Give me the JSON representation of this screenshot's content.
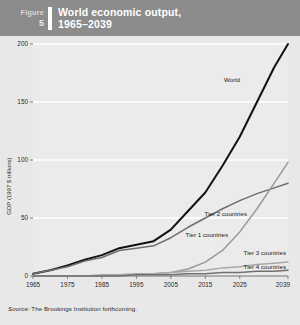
{
  "header": {
    "figure_word": "Figure",
    "figure_number": "5",
    "title_line1": "World economic output,",
    "title_line2": "1965–2039"
  },
  "source": {
    "prefix": "Source:",
    "text": "The Brookings Institution forthcoming."
  },
  "colors": {
    "header_bg": "#8c8c8c",
    "page_bg": "#e8e8e8",
    "plot_bg": "#ebebeb",
    "gridline": "#ffffff",
    "world": "#111111",
    "tier1": "#6e6e6e",
    "tier2": "#9a9a9a",
    "tier3": "#a8a8a8",
    "tier4": "#707070",
    "axis": "#555555"
  },
  "chart_data": {
    "type": "line",
    "title": "World economic output, 1965–2039",
    "xlabel": "",
    "ylabel": "GDP (1997 $ trillions)",
    "xlim": [
      1965,
      2039
    ],
    "ylim": [
      0,
      200
    ],
    "yticks": [
      0,
      50,
      100,
      150,
      200
    ],
    "xticks": [
      1965,
      1975,
      1985,
      1995,
      2005,
      2015,
      2025,
      2039
    ],
    "grid": true,
    "legend": "inline-labels",
    "x": [
      1965,
      1970,
      1975,
      1980,
      1985,
      1990,
      1995,
      2000,
      2005,
      2010,
      2015,
      2020,
      2025,
      2030,
      2035,
      2039
    ],
    "series": [
      {
        "name": "World",
        "label": "World",
        "color": "#111111",
        "values": [
          2,
          5,
          9,
          14,
          18,
          24,
          27,
          30,
          40,
          56,
          72,
          95,
          120,
          150,
          180,
          200
        ]
      },
      {
        "name": "Tier 1 countries",
        "label": "Tier 1 countries",
        "color": "#6e6e6e",
        "values": [
          2,
          5,
          8,
          13,
          16,
          22,
          24,
          26,
          33,
          42,
          50,
          58,
          65,
          71,
          76,
          80
        ]
      },
      {
        "name": "Tier 2 countries",
        "label": "Tier 2 countries",
        "color": "#9a9a9a",
        "values": [
          0,
          0,
          0,
          0,
          0,
          1,
          1,
          2,
          3,
          6,
          12,
          22,
          38,
          58,
          80,
          98
        ]
      },
      {
        "name": "Tier 3 countries",
        "label": "Tier 3 countries",
        "color": "#a8a8a8",
        "values": [
          0,
          0,
          0,
          0,
          1,
          1,
          2,
          2,
          3,
          4,
          5,
          7,
          8,
          10,
          11,
          12
        ]
      },
      {
        "name": "Tier 4 countries",
        "label": "Tier 4 countries",
        "color": "#707070",
        "values": [
          0,
          0,
          0,
          0,
          0,
          0,
          1,
          1,
          1,
          2,
          2,
          3,
          3,
          4,
          4,
          5
        ]
      }
    ],
    "ytick_labels": [
      "0",
      "50",
      "100",
      "150",
      "200"
    ],
    "xtick_labels": [
      "1965",
      "1975",
      "1985",
      "1995",
      "2005",
      "2015",
      "2025",
      "2039"
    ]
  }
}
